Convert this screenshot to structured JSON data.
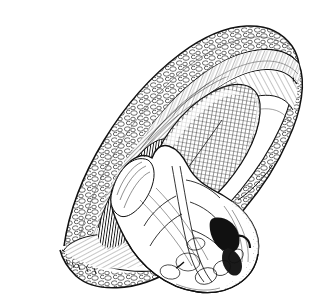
{
  "figure": {
    "technique": "pen-and-ink hatching / stipple engraving",
    "caption": "",
    "width_px": 320,
    "height_px": 308,
    "background_color": "#ffffff",
    "ink_color": "#111111",
    "colors": {
      "background": "#ffffff",
      "ink": "#111111",
      "mid_tone": "#555555",
      "light_tone": "#9a9a9a"
    },
    "has_text_labels": false,
    "label_count": 0,
    "parts": [
      {
        "id": "skin-flap-upper",
        "name": "Upper retracted skin and subcutaneous fat flap",
        "texture": "cobblestone lobules with outline cells",
        "region": "upper-left to upper-right arc"
      },
      {
        "id": "skin-flap-lower",
        "name": "Lower retracted skin and subcutaneous fat flap",
        "texture": "cobblestone lobules with outline cells",
        "region": "lower-left to lower-right arc"
      },
      {
        "id": "muscle-layer-upper",
        "name": "Upper divided chest wall musculature",
        "texture": "long parallel fibre striations",
        "region": "inner edge of upper flap"
      },
      {
        "id": "muscle-layer-lower",
        "name": "Lower divided chest wall musculature",
        "texture": "long parallel fibre striations",
        "region": "inner edge of lower flap"
      },
      {
        "id": "intercostal-bed",
        "name": "Intercostal muscle and rib bed",
        "texture": "dense short vertical hatching",
        "region": "deep left of wound"
      },
      {
        "id": "lung",
        "name": "Lung surface within pleural cavity",
        "texture": "fine cross-hatched grid, darkest mid-tone",
        "region": "centre of wound opening"
      },
      {
        "id": "heart",
        "name": "Heart delivered through the wound",
        "texture": "smooth contour with branching coronary vessels and dark crevice shading",
        "region": "lower centre-right, overlapping wound edge"
      },
      {
        "id": "coronary-vessels",
        "name": "Coronary arteries and veins on heart surface",
        "texture": "branching outlined tubular lines",
        "region": "anterior heart surface"
      },
      {
        "id": "wound-margin",
        "name": "Lens-shaped thoracotomy wound margin",
        "texture": "double outline with shadow hatch",
        "region": "full diagonal lens from lower-left to upper-right"
      },
      {
        "id": "suture-marks",
        "name": "Small suture / clip marks along lower wound edge",
        "texture": "short paired tick marks",
        "region": "lower-left margin"
      }
    ]
  }
}
